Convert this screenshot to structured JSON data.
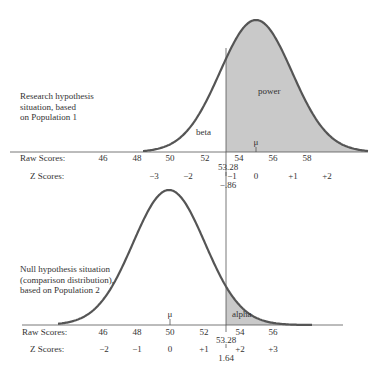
{
  "top_panel": {
    "description": [
      "Research hypothesis",
      "situation, based",
      "on Population 1"
    ],
    "area_labels": {
      "beta": "beta",
      "power": "power",
      "mu": "μ"
    },
    "raw_label": "Raw Scores:",
    "z_label": "Z Scores:",
    "raw_ticks": [
      "46",
      "48",
      "50",
      "52",
      "54",
      "56",
      "58"
    ],
    "z_ticks": [
      "−3",
      "−2",
      "−1",
      "0",
      "+1",
      "+2"
    ],
    "cutoff_raw": "53.28",
    "cutoff_z": "−.86"
  },
  "bottom_panel": {
    "description": [
      "Null hypothesis situation",
      "(comparison distribution),",
      "based on Population 2"
    ],
    "area_labels": {
      "alpha": "alpha",
      "mu": "μ"
    },
    "raw_label": "Raw Scores:",
    "z_label": "Z Scores:",
    "raw_ticks": [
      "46",
      "48",
      "50",
      "52",
      "54",
      "56"
    ],
    "z_ticks": [
      "−2",
      "−1",
      "0",
      "+1",
      "+2",
      "+3"
    ],
    "cutoff_raw": "53.28",
    "cutoff_z": "1.64"
  },
  "colors": {
    "curve": "#555555",
    "shade": "#c8c8c8",
    "axis": "#555555"
  }
}
